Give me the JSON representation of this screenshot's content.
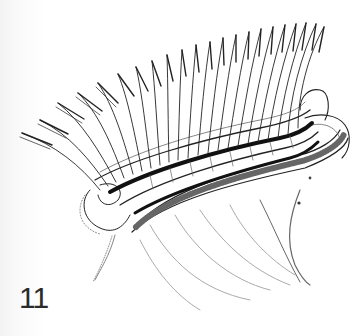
{
  "figure": {
    "label": "11",
    "colors": {
      "ink": "#222222",
      "background": "#ffffff",
      "label": "#2b2b2b"
    },
    "filament_count": 22
  }
}
